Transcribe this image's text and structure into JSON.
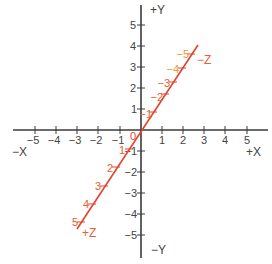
{
  "diagram": {
    "colors": {
      "axis": "#3a3a3a",
      "axis_label": "#444444",
      "z_axis": "#e0442a",
      "z_label": "#e8602e",
      "z_label_far": "#e89a3a"
    },
    "x_axis": {
      "neg_label": "−X",
      "pos_label": "+X",
      "ticks": [
        "−5",
        "−4",
        "−3",
        "−2",
        "−1",
        "1",
        "2",
        "3",
        "4",
        "5"
      ]
    },
    "y_axis": {
      "pos_label": "+Y",
      "neg_label": "−Y",
      "ticks_pos": [
        "1",
        "2",
        "3",
        "4",
        "5"
      ],
      "ticks_neg": [
        "−1",
        "−2",
        "−3",
        "−4",
        "−5"
      ]
    },
    "z_axis": {
      "pos_label": "+Z",
      "neg_label": "−Z",
      "ticks_pos": [
        "1",
        "2",
        "3",
        "4",
        "5"
      ],
      "ticks_neg": [
        "−1",
        "−2",
        "−3",
        "−4",
        "−5"
      ]
    },
    "origin_label": "0"
  }
}
